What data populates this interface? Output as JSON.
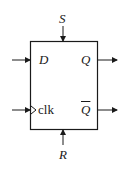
{
  "diagram": {
    "type": "D flip-flop block",
    "labels": {
      "set": "S",
      "reset": "R",
      "data": "D",
      "clock": "clk",
      "q": "Q",
      "q_bar": "Q"
    },
    "colors": {
      "stroke": "#1a1a1a",
      "background": "#ffffff"
    }
  }
}
